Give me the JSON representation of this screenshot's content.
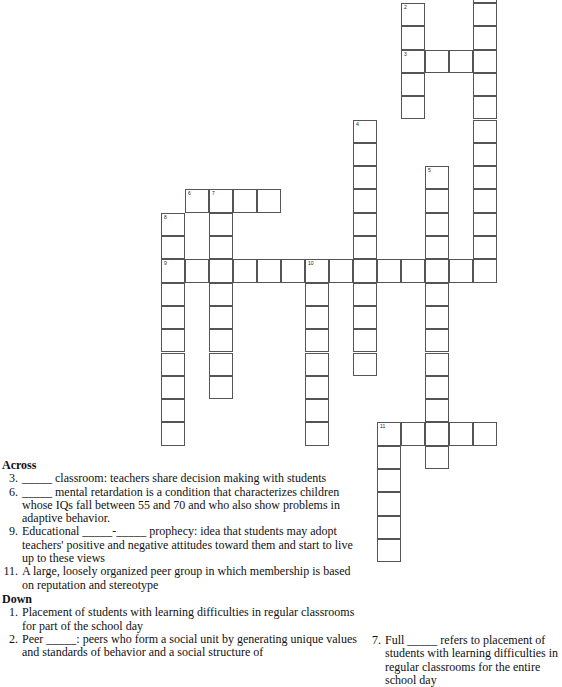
{
  "puzzle": {
    "grid": {
      "origin_x": 161,
      "origin_y": 3,
      "cell_w": 24,
      "cell_h": 23.3,
      "entries": [
        {
          "number": "1",
          "direction": "down",
          "col": 13,
          "row": -1,
          "length": 13
        },
        {
          "number": "2",
          "direction": "down",
          "col": 10,
          "row": 0,
          "length": 5
        },
        {
          "number": "3",
          "direction": "across",
          "col": 10,
          "row": 2,
          "length": 4
        },
        {
          "number": "4",
          "direction": "down",
          "col": 8,
          "row": 5,
          "length": 11
        },
        {
          "number": "5",
          "direction": "down",
          "col": 11,
          "row": 7,
          "length": 13
        },
        {
          "number": "6",
          "direction": "across",
          "col": 1,
          "row": 8,
          "length": 4
        },
        {
          "number": "7",
          "direction": "down",
          "col": 2,
          "row": 8,
          "length": 9
        },
        {
          "number": "8",
          "direction": "down",
          "col": 0,
          "row": 9,
          "length": 10
        },
        {
          "number": "9",
          "direction": "across",
          "col": 0,
          "row": 11,
          "length": 14
        },
        {
          "number": "10",
          "direction": "down",
          "col": 6,
          "row": 11,
          "length": 8
        },
        {
          "number": "11",
          "direction": "across",
          "col": 9,
          "row": 18,
          "length": 5
        },
        {
          "number": "11",
          "direction": "down",
          "col": 9,
          "row": 18,
          "length": 6
        }
      ]
    },
    "across_heading": "Across",
    "down_heading": "Down",
    "across": [
      {
        "num": "3.",
        "text": "_____ classroom: teachers share decision making with students"
      },
      {
        "num": "6.",
        "text": "_____ mental retardation is a condition that characterizes children whose IQs fall between 55 and 70 and who also show problems in adaptive behavior."
      },
      {
        "num": "9.",
        "text": "Educational _____-_____ prophecy: idea that students may adopt teachers' positive and negative attitudes toward them and start to live up to these views"
      },
      {
        "num": "11.",
        "text": "A large, loosely organized peer group in which membership is based on reputation and stereotype"
      }
    ],
    "down": [
      {
        "num": "1.",
        "text": "Placement of students with learning difficulties in regular classrooms for part of the school day"
      },
      {
        "num": "2.",
        "text": "Peer _____: peers who form a social unit by generating unique values and standards of behavior and a social structure of"
      },
      {
        "num": "7.",
        "text": "Full _____ refers to placement of students with learning difficulties in regular classrooms for the entire school day"
      }
    ]
  }
}
